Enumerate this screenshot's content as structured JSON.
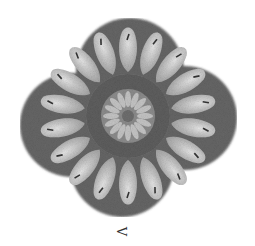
{
  "figure": {
    "label": "V",
    "colors": {
      "background": "#ffffff",
      "body_dark": "#5a5a5a",
      "body_mid": "#7a7a7a",
      "petal_light": "#d8d8d8",
      "rosette": "#9a9a9a"
    },
    "petal_count": 18,
    "rosette_segments": 16
  }
}
